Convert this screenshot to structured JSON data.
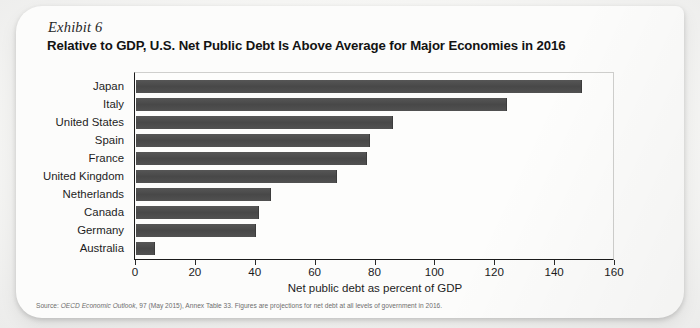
{
  "exhibit_label": "Exhibit 6",
  "title": "Relative to GDP, U.S. Net Public Debt Is Above Average for Major Economies in 2016",
  "source": {
    "prefix": "Source: ",
    "italic_part": "OECD Economic Outlook",
    "rest": ", 97 (May 2015), Annex Table 33. Figures are projections for net debt at all levels of government in 2016."
  },
  "colors": {
    "bar": "#4e4e4e",
    "axis": "#1b1b1b",
    "card": "#fcfcfb",
    "page": "#f3f3f1",
    "text": "#1d1d1d",
    "source_text": "#6d6d6d"
  },
  "chart_data": {
    "type": "bar",
    "orientation": "horizontal",
    "title": "Relative to GDP, U.S. Net Public Debt Is Above Average for Major Economies in 2016",
    "subtitle": "Exhibit 6",
    "xlabel": "Net public debt as percent of GDP",
    "ylabel": "",
    "xlim": [
      0,
      160
    ],
    "xticks": [
      0,
      20,
      40,
      60,
      80,
      100,
      120,
      140,
      160
    ],
    "xtick_labels": [
      "0",
      "20",
      "40",
      "60",
      "80",
      "100",
      "120",
      "140",
      "160"
    ],
    "grid": false,
    "legend": false,
    "categories": [
      "Japan",
      "Italy",
      "United States",
      "Spain",
      "France",
      "United Kingdom",
      "Netherlands",
      "Canada",
      "Germany",
      "Australia"
    ],
    "values": [
      149,
      124,
      86,
      78,
      77,
      67,
      45,
      41,
      40,
      6.5
    ],
    "series": [
      {
        "name": "Net public debt as percent of GDP, 2016 (projected)",
        "values": [
          149,
          124,
          86,
          78,
          77,
          67,
          45,
          41,
          40,
          6.5
        ]
      }
    ]
  }
}
